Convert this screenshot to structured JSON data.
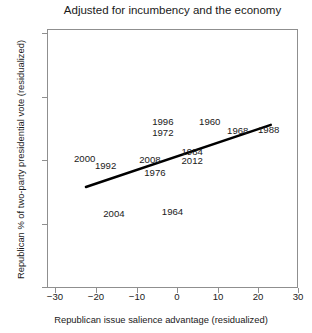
{
  "chart_data": {
    "type": "scatter",
    "title": "Adjusted for incumbency and the economy",
    "xlabel": "Republican issue salience advantage (residualized)",
    "ylabel": "Republican % of two-party presidential vote (residualized)",
    "xlim": [
      -30,
      30
    ],
    "ylim": [
      -10,
      10
    ],
    "xticks": [
      "−30",
      "−20",
      "−10",
      "0",
      "10",
      "20",
      "30"
    ],
    "xtick_values": [
      -30,
      -20,
      -10,
      0,
      10,
      20,
      30
    ],
    "yticks": [
      "10",
      "5",
      "0",
      "−5",
      "−10"
    ],
    "ytick_values": [
      10,
      5,
      0,
      -5,
      -10
    ],
    "grid": false,
    "legend": "none",
    "marker_style": "text-label",
    "points": [
      {
        "label": "2000",
        "x": -21.0,
        "y": 0.0
      },
      {
        "label": "1992",
        "x": -16.0,
        "y": -0.6
      },
      {
        "label": "2004",
        "x": -14.0,
        "y": -4.3
      },
      {
        "label": "2008",
        "x": -5.4,
        "y": -0.1
      },
      {
        "label": "1976",
        "x": -4.2,
        "y": -1.1
      },
      {
        "label": "1996",
        "x": -2.3,
        "y": 2.8
      },
      {
        "label": "1972",
        "x": -2.3,
        "y": 2.0
      },
      {
        "label": "1964",
        "x": 0.0,
        "y": -4.1
      },
      {
        "label": "1984",
        "x": 4.7,
        "y": 0.5
      },
      {
        "label": "2012",
        "x": 4.7,
        "y": -0.2
      },
      {
        "label": "1960",
        "x": 8.9,
        "y": 2.8
      },
      {
        "label": "1968",
        "x": 15.6,
        "y": 2.1
      },
      {
        "label": "1988",
        "x": 23.0,
        "y": 2.2
      }
    ],
    "fit_line": {
      "type": "linear-fit",
      "x_start": -20.7,
      "y_start": -2.2,
      "x_end": 23.5,
      "y_end": 2.6,
      "color": "#000000"
    },
    "colors": {
      "axis": "#8f8f8f",
      "text": "#1a1a1a",
      "line": "#000000",
      "background": "#ffffff"
    }
  }
}
